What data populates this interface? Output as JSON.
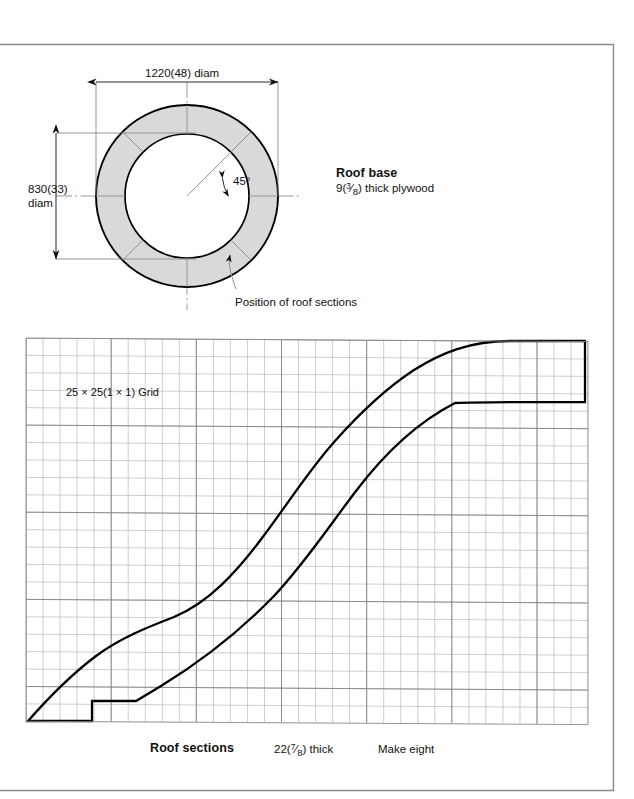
{
  "page": {
    "border_color": "#8a8a8a",
    "ink": "#111111",
    "ring_fill": "#d9d9d9",
    "grid_line": "#9a9a9a",
    "grid_line_light": "#c8c8c8",
    "outline": "#000000"
  },
  "roof_base": {
    "title": "Roof base",
    "subtitle": "9(3/8) thick plywood",
    "subtitle_number": "9(",
    "subtitle_frac_num": "3",
    "subtitle_frac_den": "8",
    "subtitle_tail": ") thick plywood",
    "dim_top": "1220(48) diam",
    "dim_left_line1": "830(33)",
    "dim_left_line2": "diam",
    "angle_label": "45°",
    "leader_label": "Position of roof sections",
    "section_count": 8,
    "section_angle_deg": 45
  },
  "roof_sections": {
    "title": "Roof sections",
    "thickness": "22(7/8) thick",
    "thickness_number": "22(",
    "thickness_frac_num": "7",
    "thickness_frac_den": "8",
    "thickness_tail": ") thick",
    "quantity": "Make eight",
    "grid_note": "25 × 25(1 × 1) Grid",
    "grid_cell_mm": 25,
    "grid_cell_in": 1,
    "grid_cols": 33,
    "grid_rows": 22
  }
}
